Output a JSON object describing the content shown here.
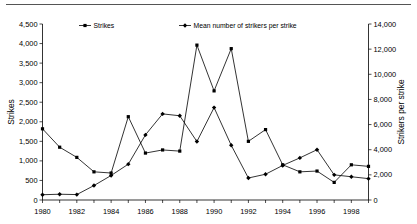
{
  "chart_data": {
    "type": "line",
    "title": "",
    "xlabel": "",
    "ylabel": "Strikes",
    "y2label": "Strikers per strike",
    "grid": false,
    "legend_position": "top",
    "x": [
      1980,
      1981,
      1982,
      1983,
      1984,
      1985,
      1986,
      1987,
      1988,
      1989,
      1990,
      1991,
      1992,
      1993,
      1994,
      1995,
      1996,
      1997,
      1998,
      1999
    ],
    "xlim": [
      1980,
      1999
    ],
    "xtick_labels": [
      "1980",
      "1982",
      "1984",
      "1986",
      "1988",
      "1990",
      "1992",
      "1994",
      "1996",
      "1998"
    ],
    "xticks": [
      1980,
      1982,
      1984,
      1986,
      1988,
      1990,
      1992,
      1994,
      1996,
      1998
    ],
    "ylim": [
      0,
      4500
    ],
    "ytick_labels": [
      "0",
      "500",
      "1,000",
      "1,500",
      "2,000",
      "2,500",
      "3,000",
      "3,500",
      "4,000",
      "4,500"
    ],
    "yticks": [
      0,
      500,
      1000,
      1500,
      2000,
      2500,
      3000,
      3500,
      4000,
      4500
    ],
    "y2lim": [
      0,
      14000
    ],
    "y2tick_labels": [
      "0",
      "2,000",
      "4,000",
      "6,000",
      "8,000",
      "10,000",
      "12,000",
      "14,000"
    ],
    "y2ticks": [
      0,
      2000,
      4000,
      6000,
      8000,
      10000,
      12000,
      14000
    ],
    "series": [
      {
        "name": "Strikes",
        "axis": "left",
        "marker": "square",
        "values": [
          1820,
          1350,
          1090,
          720,
          690,
          2130,
          1200,
          1280,
          1250,
          3960,
          2790,
          3870,
          1500,
          1800,
          900,
          720,
          740,
          450,
          900,
          860
        ]
      },
      {
        "name": "Mean number of strikers per strike",
        "axis": "right",
        "marker": "diamond",
        "values": [
          420,
          460,
          430,
          1150,
          1950,
          2850,
          5180,
          6850,
          6700,
          4650,
          7350,
          4350,
          1750,
          2050,
          2750,
          3350,
          4000,
          2000,
          1850,
          1700
        ]
      }
    ],
    "legend": [
      {
        "label": "Strikes",
        "marker": "square"
      },
      {
        "label": "Mean number of strikers per strike",
        "marker": "diamond"
      }
    ]
  }
}
